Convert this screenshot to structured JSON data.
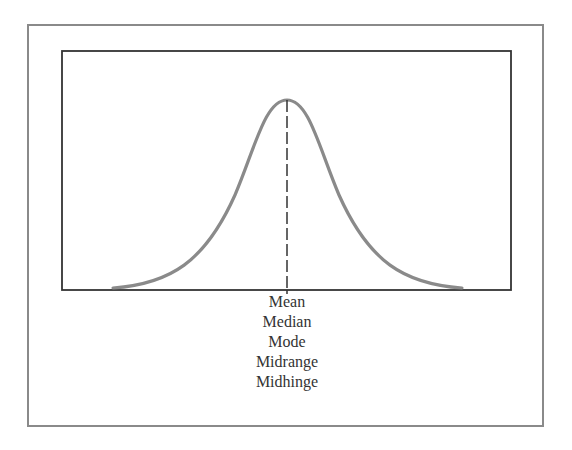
{
  "diagram": {
    "type": "symmetric-distribution",
    "curve_color": "#8a8a8a",
    "frame_color": "#333333",
    "center_line_style": "dashed",
    "center_labels": [
      "Mean",
      "Median",
      "Mode",
      "Midrange",
      "Midhinge"
    ]
  }
}
